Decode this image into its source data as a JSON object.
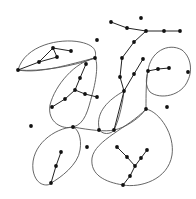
{
  "diagram": {
    "type": "graph-with-loops",
    "colors": {
      "background": "#ffffff",
      "loop": "#555555",
      "edge": "#222222",
      "node": "#111111"
    },
    "nodes": [
      {
        "id": "t1",
        "x": 111,
        "y": 22
      },
      {
        "id": "t2",
        "x": 127,
        "y": 28
      },
      {
        "id": "t3",
        "x": 146,
        "y": 31
      },
      {
        "id": "t4",
        "x": 164,
        "y": 31
      },
      {
        "id": "t5",
        "x": 180,
        "y": 31
      },
      {
        "id": "iso1",
        "x": 141,
        "y": 18
      },
      {
        "id": "v1",
        "x": 134,
        "y": 42
      },
      {
        "id": "v2",
        "x": 122,
        "y": 58
      },
      {
        "id": "v3",
        "x": 120,
        "y": 77
      },
      {
        "id": "v4",
        "x": 124,
        "y": 91
      },
      {
        "id": "w1",
        "x": 143,
        "y": 59
      },
      {
        "id": "w2",
        "x": 134,
        "y": 74
      },
      {
        "id": "r1",
        "x": 148,
        "y": 71
      },
      {
        "id": "r2",
        "x": 158,
        "y": 69
      },
      {
        "id": "r3",
        "x": 169,
        "y": 68
      },
      {
        "id": "r4",
        "x": 188,
        "y": 72
      },
      {
        "id": "a1",
        "x": 18,
        "y": 70
      },
      {
        "id": "a2",
        "x": 39,
        "y": 62
      },
      {
        "id": "a3",
        "x": 53,
        "y": 48
      },
      {
        "id": "a4",
        "x": 57,
        "y": 57
      },
      {
        "id": "a5",
        "x": 71,
        "y": 51
      },
      {
        "id": "a6",
        "x": 95,
        "y": 58
      },
      {
        "id": "m1",
        "x": 86,
        "y": 64
      },
      {
        "id": "m2",
        "x": 80,
        "y": 78
      },
      {
        "id": "m3",
        "x": 75,
        "y": 90
      },
      {
        "id": "m4",
        "x": 85,
        "y": 94
      },
      {
        "id": "m5",
        "x": 97,
        "y": 97
      },
      {
        "id": "m6",
        "x": 65,
        "y": 99
      },
      {
        "id": "m7",
        "x": 52,
        "y": 107
      },
      {
        "id": "j1",
        "x": 73,
        "y": 127
      },
      {
        "id": "j2",
        "x": 114,
        "y": 130
      },
      {
        "id": "j3",
        "x": 146,
        "y": 109
      },
      {
        "id": "l1",
        "x": 61,
        "y": 152
      },
      {
        "id": "l2",
        "x": 56,
        "y": 166
      },
      {
        "id": "l3",
        "x": 51,
        "y": 183
      },
      {
        "id": "iso2",
        "x": 31,
        "y": 126
      },
      {
        "id": "iso3",
        "x": 87,
        "y": 147
      },
      {
        "id": "iso4",
        "x": 167,
        "y": 107
      },
      {
        "id": "iso5",
        "x": 97,
        "y": 40
      },
      {
        "id": "y1",
        "x": 117,
        "y": 147
      },
      {
        "id": "y2",
        "x": 127,
        "y": 157
      },
      {
        "id": "y3",
        "x": 135,
        "y": 166
      },
      {
        "id": "y4",
        "x": 147,
        "y": 150
      },
      {
        "id": "y5",
        "x": 141,
        "y": 158
      },
      {
        "id": "y6",
        "x": 130,
        "y": 176
      },
      {
        "id": "y7",
        "x": 123,
        "y": 185
      },
      {
        "id": "p1",
        "x": 99,
        "y": 130
      }
    ]
  }
}
